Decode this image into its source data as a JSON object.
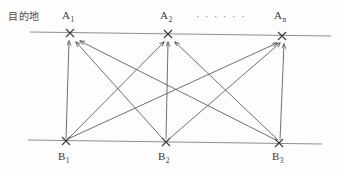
{
  "diagram": {
    "axis_title": "目的地",
    "ellipsis": "· · · · · ·",
    "line_color": "#8a8a8a",
    "edge_color": "#5a5a5a",
    "marker_color": "#3a3a3a",
    "text_color": "#3a3a3a",
    "background": "#fdfdfd"
  },
  "nodes": {
    "top": [
      {
        "id": "A1",
        "base": "A",
        "sub": "1",
        "x": 70,
        "y": 33
      },
      {
        "id": "A2",
        "base": "A",
        "sub": "2",
        "x": 168,
        "y": 34
      },
      {
        "id": "An",
        "base": "A",
        "sub": "n",
        "x": 282,
        "y": 36
      }
    ],
    "bottom": [
      {
        "id": "B1",
        "base": "B",
        "sub": "1",
        "x": 66,
        "y": 141
      },
      {
        "id": "B2",
        "base": "B",
        "sub": "2",
        "x": 166,
        "y": 142
      },
      {
        "id": "B3",
        "base": "B",
        "sub": "3",
        "x": 279,
        "y": 143
      }
    ]
  },
  "edges": [
    {
      "from": "B1",
      "to": "A1"
    },
    {
      "from": "B1",
      "to": "A2"
    },
    {
      "from": "B1",
      "to": "An"
    },
    {
      "from": "B2",
      "to": "A1"
    },
    {
      "from": "B2",
      "to": "A2"
    },
    {
      "from": "B2",
      "to": "An"
    },
    {
      "from": "B3",
      "to": "A1"
    },
    {
      "from": "B3",
      "to": "A2"
    },
    {
      "from": "B3",
      "to": "An"
    }
  ],
  "axis_lines": {
    "top": {
      "x1": 30,
      "y1": 32,
      "x2": 331,
      "y2": 36
    },
    "bottom": {
      "x1": 28,
      "y1": 140,
      "x2": 322,
      "y2": 144
    }
  }
}
